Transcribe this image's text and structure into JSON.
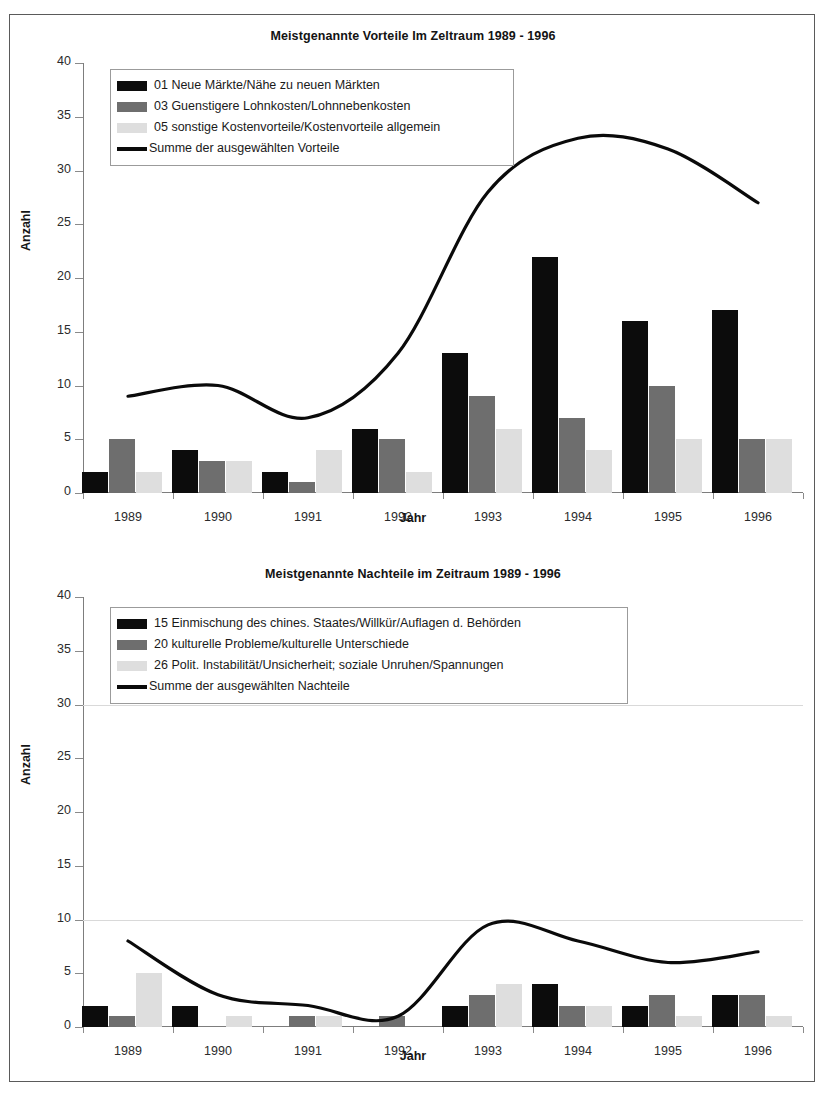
{
  "page": {
    "axis_y_title": "Anzahl",
    "axis_x_title": "Jahr"
  },
  "chart_data": [
    {
      "id": "vorteile",
      "type": "bar",
      "title": "Meistgenannte Vorteile Im Zeltraum 1989 - 1996",
      "xlabel": "Jahr",
      "ylabel": "Anzahl",
      "ylim": [
        0,
        40
      ],
      "ytick_labels": [
        "0",
        "5",
        "10",
        "15",
        "20",
        "25",
        "30",
        "35",
        "40"
      ],
      "ytick_values": [
        0,
        5,
        10,
        15,
        20,
        25,
        30,
        35,
        40
      ],
      "grid": false,
      "legend_position": "top-left",
      "categories": [
        "1989",
        "1990",
        "1991",
        "1992",
        "1993",
        "1994",
        "1995",
        "1996"
      ],
      "series": [
        {
          "name": "01 Neue Märkte/Nähe zu neuen Märkten",
          "kind": "bar",
          "color": "#0c0c0c",
          "values": [
            2,
            4,
            2,
            6,
            13,
            22,
            16,
            17
          ]
        },
        {
          "name": "03 Guenstigere Lohnkosten/Lohnnebenkosten",
          "kind": "bar",
          "color": "#6e6e6e",
          "values": [
            5,
            3,
            1,
            5,
            9,
            7,
            10,
            5
          ]
        },
        {
          "name": "05 sonstige Kostenvorteile/Kostenvorteile allgemein",
          "kind": "bar",
          "color": "#dedede",
          "values": [
            2,
            3,
            4,
            2,
            6,
            4,
            5,
            5
          ]
        },
        {
          "name": "Summe der ausgewählten Vorteile",
          "kind": "line",
          "color": "#0a0a0a",
          "values": [
            9,
            10,
            7,
            13,
            28,
            33,
            32,
            27
          ]
        }
      ]
    },
    {
      "id": "nachteile",
      "type": "bar",
      "title": "Meistgenannte Nachteile im Zeitraum 1989 - 1996",
      "xlabel": "Jahr",
      "ylabel": "Anzahl",
      "ylim": [
        0,
        40
      ],
      "ytick_labels": [
        "0",
        "5",
        "10",
        "15",
        "20",
        "25",
        "30",
        "35",
        "40"
      ],
      "ytick_values": [
        0,
        5,
        10,
        15,
        20,
        25,
        30,
        35,
        40
      ],
      "grid": true,
      "gridlines_at": [
        10,
        30
      ],
      "legend_position": "top-left",
      "categories": [
        "1989",
        "1990",
        "1991",
        "1992",
        "1993",
        "1994",
        "1995",
        "1996"
      ],
      "series": [
        {
          "name": "15 Einmischung des chines. Staates/Willkür/Auflagen d. Behörden",
          "kind": "bar",
          "color": "#0c0c0c",
          "values": [
            2,
            2,
            0,
            0,
            2,
            4,
            2,
            3
          ]
        },
        {
          "name": "20 kulturelle Probleme/kulturelle Unterschiede",
          "kind": "bar",
          "color": "#6e6e6e",
          "values": [
            1,
            0,
            1,
            1,
            3,
            2,
            3,
            3
          ]
        },
        {
          "name": "26 Polit. Instabilität/Unsicherheit; soziale Unruhen/Spannungen",
          "kind": "bar",
          "color": "#dedede",
          "values": [
            5,
            1,
            1,
            0,
            4,
            2,
            1,
            1
          ]
        },
        {
          "name": "Summe der ausgewählten Nachteile",
          "kind": "line",
          "color": "#0a0a0a",
          "values": [
            8,
            3,
            2,
            1,
            9.5,
            8,
            6,
            7
          ]
        }
      ]
    }
  ]
}
